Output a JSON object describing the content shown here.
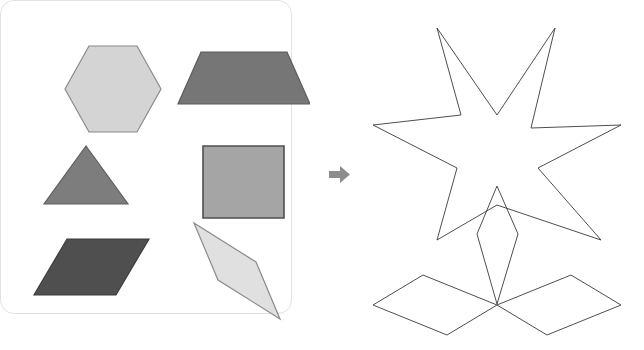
{
  "figure": {
    "background_color": "#ffffff",
    "panel_count": 2
  },
  "left_panel": {
    "name": "shape-palette-card",
    "card_fill": "#ffffff",
    "card_border_color": "#e2e2e2",
    "card_border_radius": "14px",
    "shape_count": 6,
    "shapes": [
      {
        "id": "hexagon",
        "label": "hexagon",
        "fill": "#d4d4d4",
        "stroke": "#8a8a8a",
        "points": "47,70 71,27 119,27 143,70 119,113 71,113",
        "row": 1,
        "column": 1
      },
      {
        "id": "trapezoid",
        "label": "trapezoid",
        "fill": "#767676",
        "stroke": "#5c5c5c",
        "points": "183,33 269,33 292,85 160,85",
        "row": 1,
        "column": 2
      },
      {
        "id": "triangle",
        "label": "triangle",
        "fill": "#7d7d7d",
        "stroke": "#5f5f5f",
        "points": "68,127 110,185 26,185",
        "row": 2,
        "column": 1
      },
      {
        "id": "square",
        "label": "square",
        "fill": "#a5a5a5",
        "stroke": "#4f4f4f",
        "points": "185,127 266,127 266,199 185,199",
        "row": 2,
        "column": 2
      },
      {
        "id": "parallelogram-dark",
        "label": "parallelogram",
        "fill": "#4f4f4f",
        "stroke": "#3d3d3d",
        "points": "49,220 131,220 98,276 16,276",
        "row": 3,
        "column": 1
      },
      {
        "id": "rhombus-thin",
        "label": "thin rhombus",
        "fill": "#e0e0e0",
        "stroke": "#8a8a8a",
        "points": "176,204 238,243 262,300 200,261",
        "row": 3,
        "column": 2
      }
    ]
  },
  "connector": {
    "name": "right-arrow",
    "icon": "arrow-right-icon",
    "color": "#8c8c8c",
    "direction": "right"
  },
  "right_panel": {
    "name": "assembled-figure",
    "stroke": "#3a3a3a",
    "fill": "none",
    "stroke_width": 0.9,
    "parts": [
      {
        "id": "six-point-star",
        "label": "six pointed star",
        "points": "77,18 137,105 195,18 171,118 261,115 178,158 241,230 137,195 77,230 97,158 13,115 101,105"
      },
      {
        "id": "center-rhombus",
        "label": "narrow rhombus stem",
        "points": "137,176 158,224 137,294 117,224"
      },
      {
        "id": "left-wing-parallelogram",
        "label": "left parallelogram wing",
        "points": "137,295 63,265 13,295 87,325"
      },
      {
        "id": "right-wing-parallelogram",
        "label": "right parallelogram wing",
        "points": "137,295 211,265 261,295 187,325"
      }
    ]
  }
}
